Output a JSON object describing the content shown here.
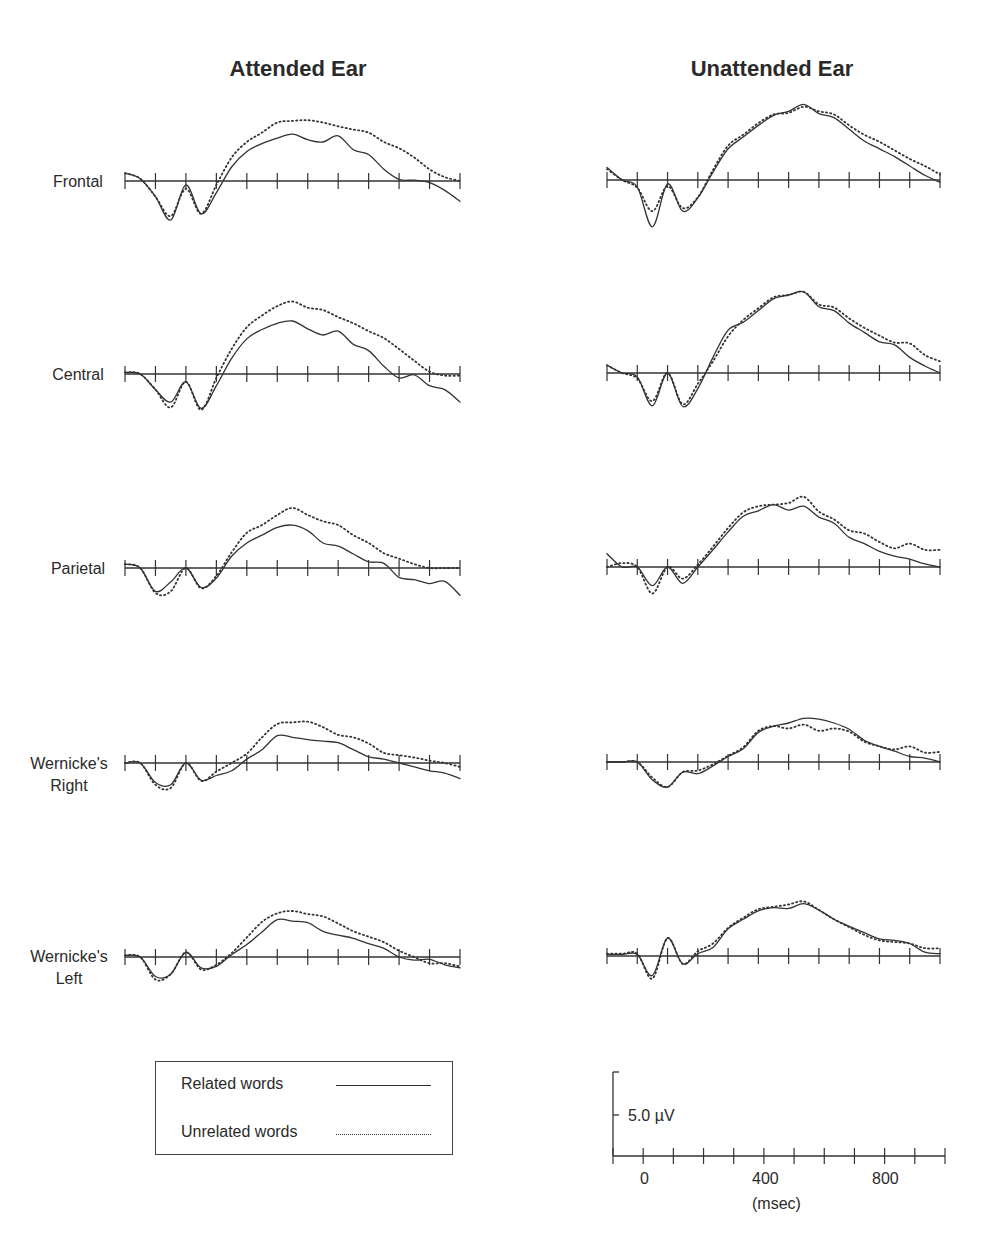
{
  "columns": [
    {
      "key": "attended",
      "title": "Attended Ear"
    },
    {
      "key": "unattended",
      "title": "Unattended Ear"
    }
  ],
  "rows": [
    {
      "key": "frontal",
      "label_lines": [
        "Frontal"
      ]
    },
    {
      "key": "central",
      "label_lines": [
        "Central"
      ]
    },
    {
      "key": "parietal",
      "label_lines": [
        "Parietal"
      ]
    },
    {
      "key": "wernicke_right",
      "label_lines": [
        "Wernicke's",
        "Right"
      ]
    },
    {
      "key": "wernicke_left",
      "label_lines": [
        "Wernicke's",
        "Left"
      ]
    }
  ],
  "legend": {
    "related": {
      "label": "Related words",
      "style": "solid"
    },
    "unrelated": {
      "label": "Unrelated words",
      "style": "dotted"
    }
  },
  "scale": {
    "amplitude_label": "5.0 µV",
    "x_tick_labels": [
      "0",
      "400",
      "800"
    ],
    "x_unit_label": "(msec)"
  },
  "chart_data": {
    "type": "line",
    "xlabel": "(msec)",
    "ylabel": "µV (positive up)",
    "x_range": [
      -100,
      1000
    ],
    "x_tick_step": 100,
    "x_tick_labels_shown": [
      0,
      400,
      800
    ],
    "amplitude_scale_bar_uV": 5.0,
    "grid": false,
    "legend_position": "bottom-left",
    "x": [
      -100,
      -50,
      0,
      50,
      100,
      150,
      200,
      250,
      300,
      350,
      400,
      450,
      500,
      550,
      600,
      650,
      700,
      750,
      800,
      850,
      900,
      950,
      1000
    ],
    "panels": [
      {
        "column": "Attended Ear",
        "row": "Frontal",
        "series": [
          {
            "name": "Related words",
            "values": [
              1,
              0.3,
              -2,
              -5,
              -0.5,
              -4.2,
              -1.5,
              1.8,
              3.8,
              4.8,
              5.5,
              6,
              5.3,
              5,
              5.8,
              4,
              3.4,
              1.5,
              0.2,
              0.1,
              -0.2,
              -1.2,
              -2.6
            ]
          },
          {
            "name": "Unrelated words",
            "values": [
              1,
              0.3,
              -2,
              -4.5,
              -1,
              -4.2,
              -0.5,
              3,
              5,
              6.2,
              7.5,
              7.7,
              7.8,
              7.5,
              7,
              6.6,
              6.2,
              5,
              4.2,
              3,
              1.5,
              0.5,
              0
            ]
          }
        ]
      },
      {
        "column": "Attended Ear",
        "row": "Central",
        "series": [
          {
            "name": "Related words",
            "values": [
              0.2,
              0,
              -2,
              -3.6,
              -1,
              -4.4,
              -1.5,
              2,
              4.5,
              5.7,
              6.5,
              6.8,
              5.8,
              5,
              5.5,
              3.8,
              3,
              1,
              -0.5,
              -0.1,
              -1.5,
              -2,
              -3.6
            ]
          },
          {
            "name": "Unrelated words",
            "values": [
              0.2,
              0,
              -2,
              -4.3,
              -1,
              -4.6,
              -0.5,
              3.2,
              6,
              7.5,
              8.7,
              9.3,
              8.5,
              8.2,
              7.3,
              6.5,
              5.5,
              4.6,
              3.2,
              1.7,
              0.3,
              -0.2,
              -0.2
            ]
          }
        ]
      },
      {
        "column": "Attended Ear",
        "row": "Parietal",
        "series": [
          {
            "name": "Related words",
            "values": [
              0.5,
              0,
              -3,
              -1.8,
              0,
              -2.5,
              -1.3,
              1.5,
              3.2,
              4.2,
              5.2,
              5.5,
              4.8,
              3.2,
              2.8,
              1.8,
              0.8,
              0.6,
              -1.2,
              -1.5,
              -2,
              -1.7,
              -3.5
            ]
          },
          {
            "name": "Unrelated words",
            "values": [
              0.5,
              0,
              -3.2,
              -3,
              0,
              -2.6,
              -1,
              2,
              4.5,
              5.5,
              6.8,
              7.7,
              6.8,
              6,
              5.5,
              4.2,
              3.2,
              1.9,
              1.2,
              0.5,
              0,
              0,
              0
            ]
          }
        ]
      },
      {
        "column": "Attended Ear",
        "row": "Wernicke's Right",
        "series": [
          {
            "name": "Related words",
            "values": [
              0,
              0,
              -2.5,
              -2.8,
              0,
              -2.2,
              -1.6,
              -1,
              0.5,
              1.7,
              3.5,
              3.3,
              3,
              2.8,
              2.6,
              1.7,
              0.8,
              0.5,
              0,
              -0.5,
              -1,
              -1.3,
              -2
            ]
          },
          {
            "name": "Unrelated words",
            "values": [
              0,
              0,
              -2.8,
              -3.2,
              0,
              -2.3,
              -1.1,
              0,
              1.2,
              3.3,
              5,
              5.2,
              5.3,
              4.6,
              3.6,
              3.3,
              2.5,
              1.3,
              1,
              0.7,
              0.3,
              0,
              -0.5
            ]
          }
        ]
      },
      {
        "column": "Attended Ear",
        "row": "Wernicke's Left",
        "series": [
          {
            "name": "Related words",
            "values": [
              0.2,
              0,
              -2.5,
              -2.2,
              0.6,
              -1.4,
              -1.2,
              0.3,
              1.6,
              3.2,
              4.8,
              4.6,
              4.4,
              3.3,
              2.8,
              2.4,
              1.7,
              1.1,
              0,
              -0.4,
              -0.3,
              -1,
              -1.4
            ]
          },
          {
            "name": "Unrelated words",
            "values": [
              0.2,
              0,
              -2.9,
              -2.2,
              0.6,
              -1.6,
              -1,
              0.5,
              2.5,
              4.5,
              5.6,
              5.9,
              5.5,
              5.2,
              4.3,
              3.3,
              2.6,
              1.9,
              0.8,
              0,
              -0.8,
              -0.8,
              -1.2
            ]
          }
        ]
      },
      {
        "column": "Unattended Ear",
        "row": "Frontal",
        "series": [
          {
            "name": "Related words",
            "values": [
              1.6,
              0,
              -0.9,
              -6,
              -0.5,
              -4,
              -2.3,
              1,
              4,
              5.5,
              7,
              8.3,
              8.8,
              9.7,
              8.5,
              8,
              6.5,
              5,
              4,
              3,
              1.8,
              0.6,
              -0.3
            ]
          },
          {
            "name": "Unrelated words",
            "values": [
              1.4,
              0,
              -1,
              -4,
              -0.8,
              -3.6,
              -2.2,
              1.3,
              4.4,
              5.8,
              7.3,
              8.4,
              8.6,
              9.4,
              8.8,
              8.4,
              7,
              5.8,
              4.9,
              3.8,
              2.7,
              1.8,
              0.7
            ]
          }
        ]
      },
      {
        "column": "Unattended Ear",
        "row": "Central",
        "series": [
          {
            "name": "Related words",
            "values": [
              1,
              0,
              -0.5,
              -4.2,
              0,
              -4.3,
              -2,
              2,
              5.5,
              6.5,
              8,
              9.5,
              10,
              10.4,
              8.5,
              8,
              6.4,
              5.2,
              4,
              3.6,
              2,
              0.9,
              0
            ]
          },
          {
            "name": "Unrelated words",
            "values": [
              1,
              0,
              -0.7,
              -3.6,
              0,
              -4,
              -1.4,
              1.5,
              4.7,
              6.8,
              8.3,
              9.7,
              10,
              10.4,
              8.8,
              8.4,
              7,
              5.8,
              4.8,
              3.9,
              3.8,
              2.3,
              1.5
            ]
          }
        ]
      },
      {
        "column": "Unattended Ear",
        "row": "Parietal",
        "series": [
          {
            "name": "Related words",
            "values": [
              1.7,
              0,
              0,
              -2.4,
              0,
              -2.1,
              0,
              2.2,
              4.5,
              6.5,
              7.2,
              8,
              7.3,
              7.8,
              6.4,
              5.6,
              3.8,
              3,
              2,
              1.4,
              1,
              0.4,
              0
            ]
          },
          {
            "name": "Unrelated words",
            "values": [
              0,
              0.5,
              0,
              -3.4,
              0,
              -1.5,
              0.3,
              2.6,
              5,
              7,
              7.8,
              8,
              8.2,
              9,
              7.1,
              6.1,
              4.7,
              4.3,
              3.2,
              2.4,
              3,
              2.2,
              2.2
            ]
          }
        ]
      },
      {
        "column": "Unattended Ear",
        "row": "Wernicke's Right",
        "series": [
          {
            "name": "Related words",
            "values": [
              0,
              0,
              0,
              -2.3,
              -3.2,
              -1.3,
              -1.5,
              -0.5,
              0.7,
              1.7,
              3.8,
              4.6,
              5,
              5.6,
              5.5,
              5,
              4.2,
              2.8,
              2,
              1.4,
              0.7,
              0.5,
              0
            ]
          },
          {
            "name": "Unrelated words",
            "values": [
              0,
              0,
              0,
              -2,
              -3.2,
              -1.3,
              -1.1,
              -0.3,
              0.8,
              1.9,
              4,
              4.6,
              4.3,
              4.8,
              4,
              4.3,
              3.9,
              2.6,
              2,
              1.6,
              2,
              1.2,
              1.3
            ]
          }
        ]
      },
      {
        "column": "Unattended Ear",
        "row": "Wernicke's Left",
        "series": [
          {
            "name": "Related words",
            "values": [
              0.2,
              0.2,
              0.2,
              -2.5,
              2.3,
              -1,
              0.3,
              1.1,
              3.5,
              4.7,
              5.8,
              6.2,
              6.1,
              6.7,
              5.9,
              4.7,
              3.8,
              3,
              2.2,
              2,
              1.6,
              0.5,
              0.3
            ]
          },
          {
            "name": "Unrelated words",
            "values": [
              0.3,
              0.3,
              0.3,
              -2.9,
              2.3,
              -1,
              0.6,
              1.6,
              3.6,
              4.9,
              6,
              6.3,
              6.6,
              7,
              5.9,
              4.7,
              3.7,
              2.7,
              2,
              1.8,
              1.6,
              1,
              1
            ]
          }
        ]
      }
    ]
  }
}
